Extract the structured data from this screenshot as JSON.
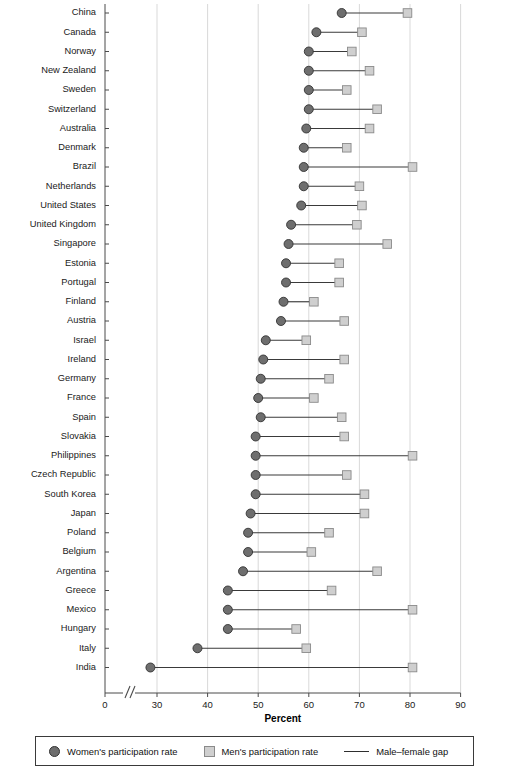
{
  "chart_data": {
    "type": "scatter",
    "title": "",
    "xlabel": "Percent",
    "ylabel": "",
    "xlim": [
      0,
      90
    ],
    "axis_break": {
      "from": 0,
      "to": 25,
      "present": true
    },
    "xticks": [
      0,
      30,
      40,
      50,
      60,
      70,
      80,
      90
    ],
    "grid": true,
    "grid_axis": "x",
    "legend_position": "bottom",
    "series": [
      {
        "name": "Women's participation rate",
        "marker": "circle",
        "color": "#6e6e6e"
      },
      {
        "name": "Men's participation rate",
        "marker": "square",
        "color": "#cfcfcf"
      },
      {
        "name": "Male–female gap",
        "marker": "line",
        "color": "#2e2e2e"
      }
    ],
    "categories": [
      "China",
      "Canada",
      "Norway",
      "New Zealand",
      "Sweden",
      "Switzerland",
      "Australia",
      "Denmark",
      "Brazil",
      "Netherlands",
      "United States",
      "United Kingdom",
      "Singapore",
      "Estonia",
      "Portugal",
      "Finland",
      "Austria",
      "Israel",
      "Ireland",
      "Germany",
      "France",
      "Spain",
      "Slovakia",
      "Philippines",
      "Czech Republic",
      "South Korea",
      "Japan",
      "Poland",
      "Belgium",
      "Argentina",
      "Greece",
      "Mexico",
      "Hungary",
      "Italy",
      "India"
    ],
    "women": [
      66.5,
      61.5,
      60.0,
      60.0,
      60.0,
      60.0,
      59.5,
      59.0,
      59.0,
      59.0,
      58.5,
      56.5,
      56.0,
      55.5,
      55.5,
      55.0,
      54.5,
      51.5,
      51.0,
      50.5,
      50.0,
      50.5,
      49.5,
      49.5,
      49.5,
      49.5,
      48.5,
      48.0,
      48.0,
      47.0,
      44.0,
      44.0,
      44.0,
      38.0,
      28.7
    ],
    "men": [
      79.5,
      70.5,
      68.5,
      72.0,
      67.5,
      73.5,
      72.0,
      67.5,
      80.5,
      70.0,
      70.5,
      69.5,
      75.5,
      66.0,
      66.0,
      61.0,
      67.0,
      59.5,
      67.0,
      64.0,
      61.0,
      66.5,
      67.0,
      80.5,
      67.5,
      71.0,
      71.0,
      64.0,
      60.5,
      73.5,
      64.5,
      80.5,
      57.5,
      59.5,
      80.5
    ]
  },
  "legend": {
    "women_label": "Women's participation rate",
    "men_label": "Men's participation rate",
    "gap_label": "Male–female gap"
  }
}
